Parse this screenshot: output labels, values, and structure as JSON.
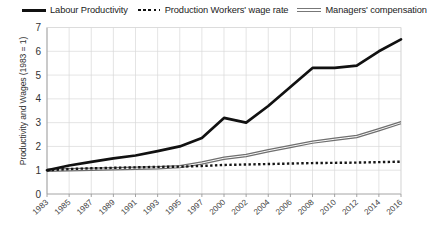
{
  "chart_data": {
    "type": "line",
    "title": "",
    "xlabel": "",
    "ylabel": "Productivity and Wages (1983 = 1)",
    "ylim": [
      0,
      7
    ],
    "yticks": [
      0,
      1,
      2,
      3,
      4,
      5,
      6,
      7
    ],
    "grid": true,
    "legend_position": "top",
    "categories": [
      "1983",
      "1985",
      "1987",
      "1989",
      "1991",
      "1993",
      "1995",
      "1997",
      "2000",
      "2002",
      "2004",
      "2006",
      "2008",
      "2010",
      "2012",
      "2014",
      "2016"
    ],
    "series": [
      {
        "name": "Labour Productivity",
        "style": "solid-thick-black",
        "color": "#111111",
        "values": [
          1.0,
          1.2,
          1.35,
          1.5,
          1.62,
          1.8,
          2.0,
          2.35,
          3.2,
          3.0,
          3.7,
          4.5,
          5.3,
          5.3,
          5.4,
          6.0,
          6.5
        ]
      },
      {
        "name": "Production Workers' wage rate",
        "style": "dotted-black",
        "color": "#161616",
        "values": [
          1.0,
          1.05,
          1.08,
          1.1,
          1.12,
          1.14,
          1.15,
          1.18,
          1.22,
          1.24,
          1.26,
          1.28,
          1.3,
          1.31,
          1.32,
          1.34,
          1.36
        ]
      },
      {
        "name": "Managers' compensation",
        "style": "double-gray",
        "color": "#6f6f6f",
        "values": [
          1.0,
          1.02,
          1.04,
          1.06,
          1.08,
          1.1,
          1.15,
          1.3,
          1.5,
          1.62,
          1.82,
          2.0,
          2.18,
          2.3,
          2.42,
          2.7,
          3.0
        ]
      }
    ]
  },
  "legend": {
    "items": [
      {
        "label": "Labour Productivity",
        "key": "solid-line-key"
      },
      {
        "label": "Production Workers' wage rate",
        "key": "dotted-line-key"
      },
      {
        "label": "Managers' compensation",
        "key": "double-line-key"
      }
    ]
  },
  "axes": {
    "y_title": "Productivity and Wages (1983 = 1)"
  }
}
